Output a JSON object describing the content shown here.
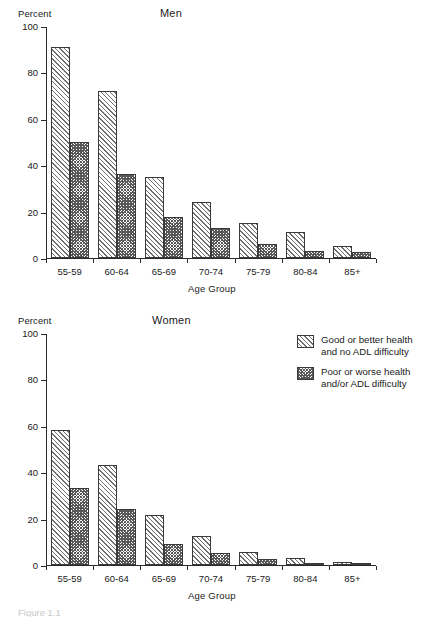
{
  "figure": {
    "y_axis_unit_label": "Percent",
    "x_axis_title": "Age Group",
    "caption_partial": "Figure 1.1"
  },
  "legend": {
    "position": "right of lower panel",
    "entries": [
      {
        "swatch": "diagonal-hatch",
        "label": "Good or better health\nand no ADL difficulty"
      },
      {
        "swatch": "cross-hatch",
        "label": "Poor or worse health\nand/or ADL difficulty"
      }
    ]
  },
  "chart_data": [
    {
      "type": "bar",
      "title": "Men",
      "xlabel": "Age Group",
      "ylabel": "Percent",
      "ylim": [
        0,
        100
      ],
      "yticks": [
        0,
        20,
        40,
        60,
        80,
        100
      ],
      "grid": false,
      "categories": [
        "55-59",
        "60-64",
        "65-69",
        "70-74",
        "75-79",
        "80-84",
        "85+"
      ],
      "series": [
        {
          "name": "Good or better health and no ADL difficulty",
          "values": [
            91,
            72,
            35,
            24,
            15,
            11,
            5
          ]
        },
        {
          "name": "Poor or worse health and/or ADL difficulty",
          "values": [
            50,
            36,
            17.5,
            13,
            6,
            3,
            2.5
          ]
        }
      ]
    },
    {
      "type": "bar",
      "title": "Women",
      "xlabel": "Age Group",
      "ylabel": "Percent",
      "ylim": [
        0,
        100
      ],
      "yticks": [
        0,
        20,
        40,
        60,
        80,
        100
      ],
      "grid": false,
      "categories": [
        "55-59",
        "60-64",
        "65-69",
        "70-74",
        "75-79",
        "80-84",
        "85+"
      ],
      "series": [
        {
          "name": "Good or better health and no ADL difficulty",
          "values": [
            58,
            43,
            21.5,
            12.5,
            5.5,
            3,
            1.5
          ]
        },
        {
          "name": "Poor or worse health and/or ADL difficulty",
          "values": [
            33,
            24,
            9,
            5,
            2.5,
            0.5,
            0.3
          ]
        }
      ]
    }
  ]
}
